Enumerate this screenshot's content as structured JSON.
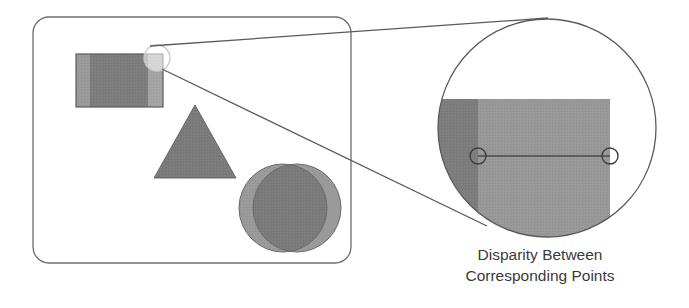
{
  "colors": {
    "stroke": "#5a5a5a",
    "shape_dark": "#7b7b7b",
    "shape_light": "#9a9a9a",
    "shape_lighter": "#a8a8a8",
    "magnified_dark": "#7d7d7d",
    "magnified_light": "#989898",
    "frame": "#6e6e6e",
    "text": "#3a3a3a"
  },
  "scene": {
    "frame": {
      "x": 33,
      "y": 17,
      "width": 318,
      "height": 246,
      "corner_radius": 16
    },
    "rectangle": {
      "x": 76,
      "y": 54,
      "width": 87,
      "height": 53,
      "left_offset_strip_width": 14,
      "right_offset_strip_width": 15
    },
    "triangle": {
      "apex": [
        195,
        105
      ],
      "base_left": [
        154,
        178
      ],
      "base_right": [
        236,
        178
      ]
    },
    "circles": [
      {
        "cx": 283,
        "cy": 208,
        "r": 44
      },
      {
        "cx": 297,
        "cy": 208,
        "r": 44
      }
    ],
    "magnify_source": {
      "cx": 157,
      "cy": 58,
      "r": 13
    }
  },
  "magnifier": {
    "cx": 547,
    "cy": 128,
    "r": 109,
    "region_top": 99,
    "dark_strip": {
      "x_start": 438,
      "x_end": 478
    },
    "light_region": {
      "x_start": 478,
      "x_end": 610
    },
    "point_left": {
      "cx": 478,
      "cy": 156,
      "r": 8
    },
    "point_right": {
      "cx": 610,
      "cy": 156,
      "r": 8
    }
  },
  "connector_lines": [
    {
      "x1": 150,
      "y1": 46,
      "x2": 548,
      "y2": 18
    },
    {
      "x1": 162,
      "y1": 69,
      "x2": 487,
      "y2": 226
    }
  ],
  "caption": {
    "line1": "Disparity Between",
    "line2": "Corresponding Points"
  }
}
